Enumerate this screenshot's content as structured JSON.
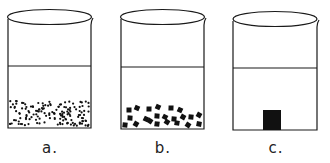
{
  "figure": {
    "beakers": [
      {
        "id": "a",
        "label": "a.",
        "contents": "many small fine particles settled at bottom",
        "particle_type": "fine-dots"
      },
      {
        "id": "b",
        "label": "b.",
        "contents": "fewer larger particles settled at bottom",
        "particle_type": "medium-squares"
      },
      {
        "id": "c",
        "label": "c.",
        "contents": "single solid block at bottom",
        "particle_type": "single-block"
      }
    ],
    "colors": {
      "line": "#1a1a1a",
      "particle": "#111111",
      "background": "#ffffff"
    }
  }
}
